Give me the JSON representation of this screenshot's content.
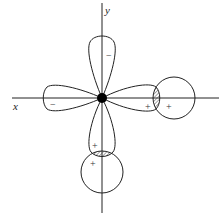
{
  "diagram": {
    "type": "orbital-overlap",
    "axes": {
      "x_label": "x",
      "y_label": "y"
    },
    "center_nucleus": {
      "cx": 102,
      "cy": 98,
      "r": 5,
      "color": "#000000"
    },
    "d_orbital_lobes": [
      {
        "direction": "up",
        "sign": "−"
      },
      {
        "direction": "left",
        "sign": "−"
      },
      {
        "direction": "right",
        "sign": "+"
      },
      {
        "direction": "down",
        "sign": "+"
      }
    ],
    "s_orbitals": [
      {
        "position": "right",
        "cx": 174,
        "cy": 98,
        "r": 21,
        "sign": "+"
      },
      {
        "position": "bottom",
        "cx": 102,
        "cy": 172,
        "r": 21,
        "sign": "+"
      }
    ],
    "overlap_regions": [
      {
        "position": "right",
        "style": "hatched"
      },
      {
        "position": "bottom",
        "style": "hatched"
      }
    ],
    "signs": {
      "top_lobe": "−",
      "left_lobe": "−",
      "right_lobe": "+",
      "right_circle": "+",
      "bottom_lobe": "+",
      "bottom_circle": "+"
    },
    "colors": {
      "stroke": "#222222",
      "hatch": "#555555",
      "background": "#ffffff"
    }
  }
}
